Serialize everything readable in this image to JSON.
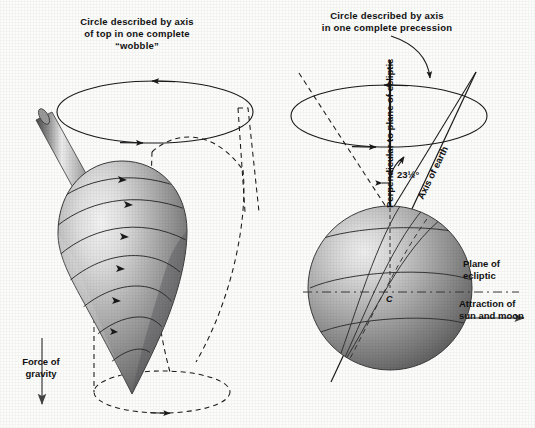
{
  "figure": {
    "background_color": "#fdfdfc",
    "ink_color": "#1a1a1a",
    "panels": [
      {
        "id": "spinning-top",
        "caption": "Circle described by axis\nof top in one complete\n“wobble”",
        "labels": [
          {
            "name": "force-of-gravity",
            "text": "Force of\ngravity"
          }
        ]
      },
      {
        "id": "earth-precession",
        "caption": "Circle described by axis\nin one complete precession",
        "labels": [
          {
            "name": "perpendicular-to-ecliptic",
            "text": "Perpendicular to plane of ecliptic"
          },
          {
            "name": "axis-of-earth",
            "text": "Axis of earth"
          },
          {
            "name": "tilt-angle",
            "text": "23½°"
          },
          {
            "name": "earth-center",
            "text": "C"
          },
          {
            "name": "plane-of-ecliptic",
            "text": "Plane of\necliptic"
          },
          {
            "name": "attraction-of-sun-and-moon",
            "text": "Attraction of\nsun and moon"
          }
        ]
      }
    ]
  },
  "left_panel": {
    "caption": "Circle described by axis\nof top in one complete\n“wobble”",
    "gravity_label": "Force of\ngravity"
  },
  "right_panel": {
    "caption": "Circle described by axis\nin one complete precession",
    "perpendicular_label": "Perpendicular to plane of ecliptic",
    "axis_label": "Axis of earth",
    "angle_label": "23½°",
    "center_label": "C",
    "ecliptic_label": "Plane of\necliptic",
    "attraction_label": "Attraction of\nsun and moon"
  }
}
